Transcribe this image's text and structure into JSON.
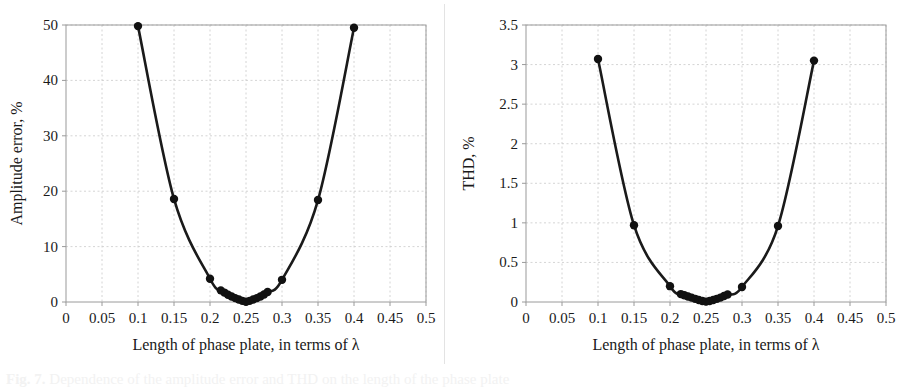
{
  "figure": {
    "caption_label": "Fig. 7.",
    "caption_rest": " Dependence of the amplitude error and THD on the length of the phase plate"
  },
  "panels": [
    {
      "id": "amplitude-error",
      "ylabel": "Amplitude error, %",
      "xlabel": "Length of phase plate, in terms of λ",
      "ytick_labels": [
        "0",
        "10",
        "20",
        "30",
        "40",
        "50"
      ],
      "xtick_labels": [
        "0",
        "0.05",
        "0.1",
        "0.15",
        "0.2",
        "0.25",
        "0.3",
        "0.35",
        "0.4",
        "0.45",
        "0.5"
      ]
    },
    {
      "id": "thd",
      "ylabel": "THD, %",
      "xlabel": "Length of phase plate, in terms of λ",
      "ytick_labels": [
        "0",
        "0.5",
        "1",
        "1.5",
        "2",
        "2.5",
        "3",
        "3.5"
      ],
      "xtick_labels": [
        "0",
        "0.05",
        "0.1",
        "0.15",
        "0.2",
        "0.25",
        "0.3",
        "0.35",
        "0.4",
        "0.45",
        "0.5"
      ]
    }
  ],
  "style": {
    "line_color": "#1a1a1a",
    "marker_color": "#111111",
    "grid_color": "#c9c9c9",
    "axis_color": "#9a9a9a",
    "background": "#ffffff"
  },
  "chart_data": [
    {
      "type": "line",
      "title": "",
      "xlabel": "Length of phase plate, in terms of λ",
      "ylabel": "Amplitude error, %",
      "xlim": [
        0,
        0.5
      ],
      "ylim": [
        0,
        50
      ],
      "xticks": [
        0,
        0.05,
        0.1,
        0.15,
        0.2,
        0.25,
        0.3,
        0.35,
        0.4,
        0.45,
        0.5
      ],
      "yticks": [
        0,
        10,
        20,
        30,
        40,
        50
      ],
      "grid": true,
      "legend": "none",
      "markers": true,
      "series": [
        {
          "name": "Amplitude error",
          "x": [
            0.1,
            0.15,
            0.2,
            0.215,
            0.22,
            0.225,
            0.23,
            0.235,
            0.24,
            0.245,
            0.25,
            0.255,
            0.26,
            0.265,
            0.27,
            0.275,
            0.28,
            0.3,
            0.35,
            0.4
          ],
          "values": [
            49.8,
            18.6,
            4.2,
            2.1,
            1.7,
            1.3,
            1.0,
            0.7,
            0.45,
            0.2,
            0.05,
            0.2,
            0.45,
            0.7,
            1.0,
            1.35,
            1.8,
            4.0,
            18.4,
            49.5
          ]
        }
      ]
    },
    {
      "type": "line",
      "title": "",
      "xlabel": "Length of phase plate, in terms of λ",
      "ylabel": "THD, %",
      "xlim": [
        0,
        0.5
      ],
      "ylim": [
        0,
        3.5
      ],
      "xticks": [
        0,
        0.05,
        0.1,
        0.15,
        0.2,
        0.25,
        0.3,
        0.35,
        0.4,
        0.45,
        0.5
      ],
      "yticks": [
        0,
        0.5,
        1,
        1.5,
        2,
        2.5,
        3,
        3.5
      ],
      "grid": true,
      "legend": "none",
      "markers": true,
      "series": [
        {
          "name": "THD",
          "x": [
            0.1,
            0.15,
            0.2,
            0.215,
            0.22,
            0.225,
            0.23,
            0.235,
            0.24,
            0.245,
            0.25,
            0.255,
            0.26,
            0.265,
            0.27,
            0.275,
            0.28,
            0.3,
            0.35,
            0.4
          ],
          "values": [
            3.07,
            0.97,
            0.2,
            0.1,
            0.085,
            0.07,
            0.055,
            0.04,
            0.025,
            0.012,
            0.005,
            0.012,
            0.025,
            0.04,
            0.055,
            0.075,
            0.095,
            0.19,
            0.96,
            3.05
          ]
        }
      ]
    }
  ]
}
